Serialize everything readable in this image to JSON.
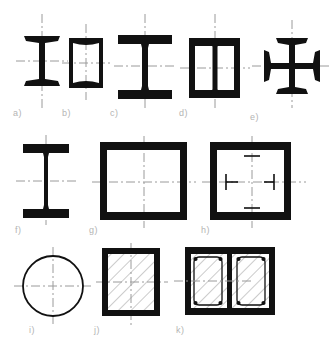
{
  "sheet": {
    "title": "Structural cross-section profiles",
    "background": "#ffffff",
    "ink": "#111111",
    "centerline_color": "#9a9a9a",
    "label_color": "#b4b4b4",
    "hatch_color": "#8c8c8c"
  },
  "figures": [
    {
      "key": "a",
      "label": "a)",
      "name": "narrow-i-beam-tapered-flange",
      "description": "Narrow I-beam with tapered flanges and thin web",
      "axes": {
        "horizontal": true,
        "vertical": true
      }
    },
    {
      "key": "b",
      "label": "b)",
      "name": "rectangular-hollow-tube",
      "description": "Hollow rectangular tube, uniform wall thickness",
      "axes": {
        "horizontal": true,
        "vertical": true
      }
    },
    {
      "key": "c",
      "label": "c)",
      "name": "wide-flange-i-beam",
      "description": "Wide flange I-beam (H-section)",
      "axes": {
        "horizontal": true,
        "vertical": true
      }
    },
    {
      "key": "d",
      "label": "d)",
      "name": "built-up-box-two-channels",
      "description": "Built-up box made of two channels with central web plate",
      "axes": {
        "horizontal": true,
        "vertical": true
      }
    },
    {
      "key": "e",
      "label": "e)",
      "name": "cruciform-section",
      "description": "Cruciform section of four tapered flanges on a cross web",
      "axes": {
        "horizontal": true,
        "vertical": true
      }
    },
    {
      "key": "f",
      "label": "f)",
      "name": "tall-narrow-i-beam",
      "description": "Tall narrow welded I-beam with thin web",
      "axes": {
        "horizontal": true,
        "vertical": true
      }
    },
    {
      "key": "g",
      "label": "g)",
      "name": "large-hollow-box-section",
      "description": "Large square hollow box section built of four plates",
      "axes": {
        "horizontal": true,
        "vertical": true
      }
    },
    {
      "key": "h",
      "label": "h)",
      "name": "box-section-with-stiffeners",
      "description": "Box section with four internal stiffener marks",
      "axes": {
        "horizontal": true,
        "vertical": true
      }
    },
    {
      "key": "i",
      "label": "i)",
      "name": "circular-hollow-section",
      "description": "Circular hollow section (tube)",
      "axes": {
        "horizontal": true,
        "vertical": true
      }
    },
    {
      "key": "j",
      "label": "j)",
      "name": "concrete-filled-box",
      "description": "Steel box section fully filled with hatched concrete",
      "axes": {
        "horizontal": true,
        "vertical": true
      }
    },
    {
      "key": "k",
      "label": "k)",
      "name": "concrete-box-twin-rebar-cages",
      "description": "Concrete filled box with twin reinforcement cages and central web",
      "axes": {
        "horizontal": true,
        "vertical": false
      }
    }
  ]
}
